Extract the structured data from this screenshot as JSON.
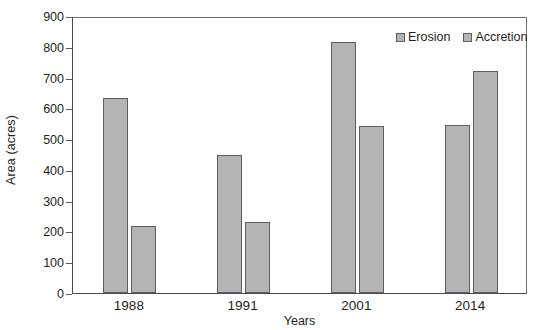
{
  "chart_data": {
    "type": "bar",
    "title": "",
    "xlabel": "Years",
    "ylabel": "Area (acres)",
    "categories": [
      "1988",
      "1991",
      "2001",
      "2014"
    ],
    "series": [
      {
        "name": "Erosion",
        "values": [
          635,
          448,
          817,
          545
        ]
      },
      {
        "name": "Accretion",
        "values": [
          217,
          232,
          543,
          722
        ]
      }
    ],
    "ylim": [
      0,
      900
    ],
    "yticks": [
      0,
      100,
      200,
      300,
      400,
      500,
      600,
      700,
      800,
      900
    ],
    "ytick_labels": [
      "0",
      "100",
      "200",
      "300",
      "400",
      "500",
      "600",
      "700",
      "800",
      "900"
    ],
    "grid": false,
    "legend_position": "top-right",
    "bar_fill_color": "#b4b4b4",
    "bar_border_color": "#5e5e5e",
    "axis_color": "#4a4a4a",
    "text_color": "#231f20"
  },
  "legend": {
    "items": [
      {
        "label": "Erosion"
      },
      {
        "label": "Accretion"
      }
    ]
  },
  "caption": {
    "text": ""
  }
}
